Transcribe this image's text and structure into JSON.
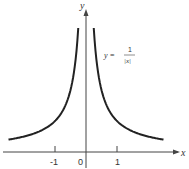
{
  "chart_data": {
    "type": "line",
    "title": "",
    "function": "y = 1/|x|",
    "xlabel": "x",
    "ylabel": "y",
    "xlim": [
      -2.6,
      2.6
    ],
    "ylim": [
      0,
      4.2
    ],
    "x_ticks": [
      "-1",
      "0",
      "1"
    ],
    "grid": false,
    "legend": null,
    "annotation": {
      "lhs": "y =",
      "numerator": "1",
      "denominator": "|x|"
    },
    "series": [
      {
        "name": "left branch",
        "x": [
          -2.5,
          -2.0,
          -1.5,
          -1.0,
          -0.75,
          -0.5,
          -0.4,
          -0.3,
          -0.25
        ],
        "y": [
          0.4,
          0.5,
          0.667,
          1.0,
          1.333,
          2.0,
          2.5,
          3.333,
          4.0
        ]
      },
      {
        "name": "right branch",
        "x": [
          0.25,
          0.3,
          0.4,
          0.5,
          0.75,
          1.0,
          1.5,
          2.0,
          2.5
        ],
        "y": [
          4.0,
          3.333,
          2.5,
          2.0,
          1.333,
          1.0,
          0.667,
          0.5,
          0.4
        ]
      }
    ]
  },
  "labels": {
    "x_axis": "x",
    "y_axis": "y",
    "tick_neg1": "-1",
    "tick_0": "0",
    "tick_1": "1",
    "eq_lhs": "y =",
    "eq_num": "1",
    "eq_den": "|x|"
  },
  "colors": {
    "curve": "#222222",
    "axis": "#444444",
    "text": "#333333"
  }
}
